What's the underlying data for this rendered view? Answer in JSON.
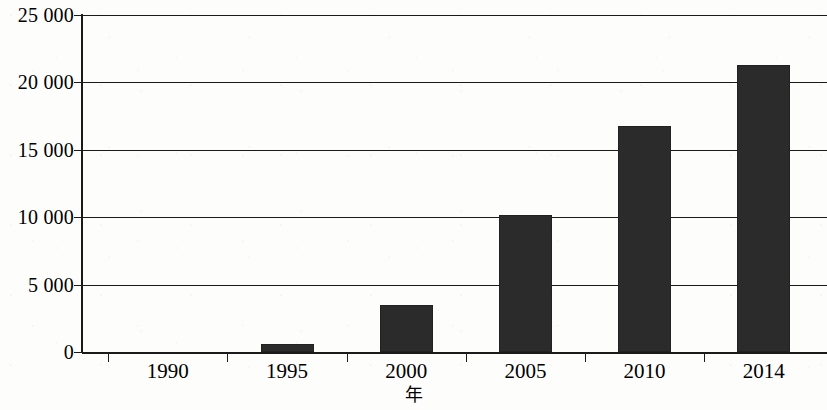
{
  "chart_data": {
    "type": "bar",
    "title": "",
    "subtitle": "",
    "xlabel": "年",
    "ylabel": "",
    "categories": [
      "1990",
      "1995",
      "2000",
      "2005",
      "2010",
      "2014"
    ],
    "values": [
      0,
      600,
      3450,
      10200,
      16800,
      21300
    ],
    "series": [
      {
        "name": "",
        "values": [
          0,
          600,
          3450,
          10200,
          16800,
          21300
        ]
      }
    ],
    "ylim": [
      0,
      25000
    ],
    "ytick_values": [
      0,
      5000,
      10000,
      15000,
      20000,
      25000
    ],
    "ytick_labels": [
      "0",
      "5 000",
      "10 000",
      "15 000",
      "20 000",
      "25 000"
    ],
    "xtick_labels": [
      "1990",
      "1995",
      "2000",
      "2005",
      "2010",
      "2014"
    ],
    "grid": true,
    "grid_axis": "y",
    "legend": false,
    "legend_position": "none",
    "bar_color": "#2b2b2b",
    "axis_color": "#1a1a1a",
    "background_color": "#ffffff",
    "annotations": []
  }
}
